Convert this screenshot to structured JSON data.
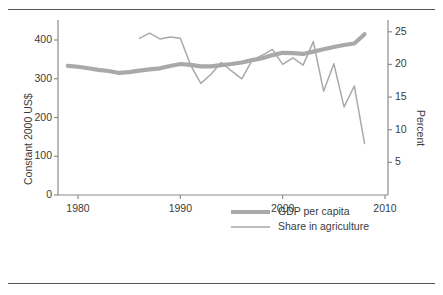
{
  "chart_data": {
    "type": "line",
    "title": "",
    "xlabel": "",
    "ylabel": "Constant 2000 US$",
    "ylabel_right": "Percent",
    "xlim": [
      1978,
      2010.5
    ],
    "ylim": [
      0,
      430
    ],
    "ylim_right": [
      0,
      26.5
    ],
    "xticks": [
      1980,
      1990,
      2000,
      2010
    ],
    "yticks_left": [
      0,
      100,
      200,
      300,
      400
    ],
    "yticks_right": [
      5,
      10,
      15,
      20,
      25
    ],
    "grid": false,
    "legend_position": "lower-right",
    "series": [
      {
        "name": "GDP per capita",
        "axis": "left",
        "units": "Constant 2000 US$",
        "linewidth": "thick",
        "color": "#a9a9a9",
        "x": [
          1979,
          1980,
          1981,
          1982,
          1983,
          1984,
          1985,
          1986,
          1987,
          1988,
          1989,
          1990,
          1991,
          1992,
          1993,
          1994,
          1995,
          1996,
          1997,
          1998,
          1999,
          2000,
          2001,
          2002,
          2003,
          2004,
          2005,
          2006,
          2007,
          2008
        ],
        "y": [
          333,
          331,
          327,
          323,
          320,
          315,
          317,
          321,
          324,
          327,
          333,
          338,
          336,
          332,
          332,
          335,
          338,
          342,
          348,
          353,
          361,
          367,
          366,
          364,
          370,
          376,
          382,
          387,
          391,
          415
        ]
      },
      {
        "name": "Share in agriculture",
        "axis": "right",
        "units": "Percent",
        "linewidth": "thin",
        "color": "#a9a9a9",
        "x": [
          1986,
          1987,
          1988,
          1989,
          1990,
          1991,
          1992,
          1993,
          1994,
          1995,
          1996,
          1997,
          1998,
          1999,
          2000,
          2001,
          2002,
          2003,
          2004,
          2005,
          2006,
          2007,
          2008
        ],
        "y": [
          24.0,
          24.8,
          23.9,
          24.2,
          24.0,
          19.9,
          17.1,
          18.5,
          20.3,
          19.0,
          17.8,
          20.6,
          21.4,
          22.3,
          20.0,
          21.0,
          19.9,
          23.5,
          15.9,
          20.1,
          13.5,
          16.7,
          7.9
        ]
      }
    ]
  },
  "legend": {
    "items": [
      {
        "label": "GDP per capita",
        "style": "thick"
      },
      {
        "label": "Share in agriculture",
        "style": "thin"
      }
    ]
  },
  "axis_titles": {
    "left": "Constant 2000 US$",
    "right": "Percent"
  },
  "colors": {
    "series": "#a9a9a9",
    "axis": "#8c8c8c",
    "text": "#3b3b3b",
    "rule": "#555555"
  }
}
